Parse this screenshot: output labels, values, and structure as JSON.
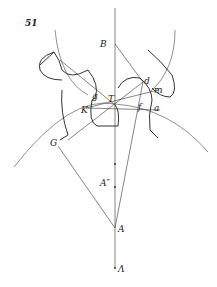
{
  "figure": {
    "number": "51",
    "points": {
      "B": "B",
      "d": "d",
      "m": "m",
      "g": "g",
      "T": "T",
      "K": "K",
      "f": "f",
      "a": "a",
      "G": "G",
      "A2": "A″",
      "A": "A",
      "Lambda": "Λ"
    }
  }
}
